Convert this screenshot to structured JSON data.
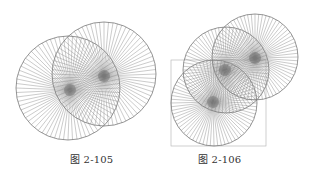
{
  "figures": [
    {
      "caption": "图 2-105",
      "circles": [
        {
          "cx": 68,
          "cy": 88,
          "r": 52,
          "spokes": 72
        },
        {
          "cx": 104,
          "cy": 74,
          "r": 52,
          "spokes": 72
        }
      ],
      "hubs": [
        {
          "cx": 70,
          "cy": 90
        },
        {
          "cx": 104,
          "cy": 76
        }
      ]
    },
    {
      "caption": "图 2-106",
      "circles": [
        {
          "cx": 214,
          "cy": 103,
          "r": 43,
          "spokes": 72
        },
        {
          "cx": 226,
          "cy": 70,
          "r": 43,
          "spokes": 72
        },
        {
          "cx": 255,
          "cy": 57,
          "r": 43,
          "spokes": 72
        }
      ],
      "hubs": [
        {
          "cx": 213,
          "cy": 102
        },
        {
          "cx": 225,
          "cy": 70
        },
        {
          "cx": 255,
          "cy": 58
        }
      ],
      "rect": {
        "x": 171,
        "y": 60,
        "w": 95,
        "h": 86
      }
    }
  ],
  "colors": {
    "line": "#8a8a8a",
    "hub": "#555555",
    "caption": "#333333"
  }
}
